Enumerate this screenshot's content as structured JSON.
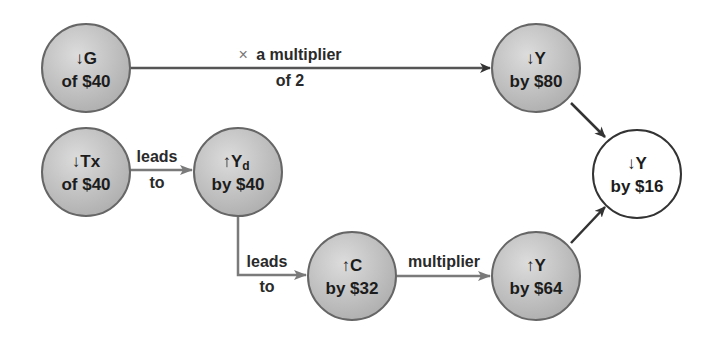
{
  "diagram": {
    "nodes": {
      "g": {
        "line1": "↓G",
        "line2": "of $40",
        "fill": "#c4c4c4"
      },
      "y80": {
        "line1": "↓Y",
        "line2": "by $80",
        "fill": "#c4c4c4"
      },
      "tx": {
        "line1": "↓Tx",
        "line2": "of $40",
        "fill": "#c4c4c4"
      },
      "yd": {
        "line1": "↑Y",
        "line1_sub": "d",
        "line2": "by $40",
        "fill": "#c4c4c4"
      },
      "c": {
        "line1": "↑C",
        "line2": "by $32",
        "fill": "#c4c4c4"
      },
      "y64": {
        "line1": "↑Y",
        "line2": "by $64",
        "fill": "#c4c4c4"
      },
      "y16": {
        "line1": "↓Y",
        "line2": "by $16",
        "fill": "#ffffff"
      }
    },
    "edges": {
      "g_to_y80": {
        "symbol": "×",
        "line1": "a multiplier",
        "line2": "of 2"
      },
      "tx_to_yd": {
        "line1": "leads",
        "line2": "to"
      },
      "yd_to_c": {
        "line1": "leads",
        "line2": "to"
      },
      "c_to_y64": {
        "line1": "multiplier"
      }
    },
    "colors": {
      "node_fill": "#c4c4c4",
      "node_stroke": "#666666",
      "arrow_dark": "#333333",
      "arrow_gray": "#7a7a7a",
      "result_fill": "#ffffff"
    }
  }
}
